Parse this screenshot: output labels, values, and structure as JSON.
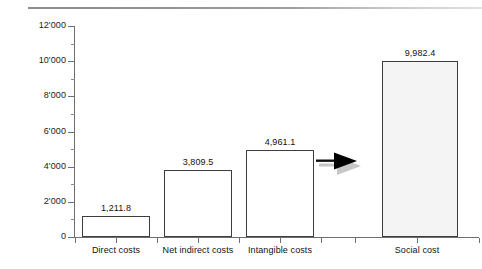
{
  "figure": {
    "background_color": "#ffffff",
    "top_rule_color": "#8d8d8d",
    "axis_color": "#6f6f6f",
    "bar_outline_color": "#3d3d3d",
    "bar_fill_color": "#ffffff",
    "bar_fill_highlight_color": "#f4f4f4",
    "arrow_color": "#000000",
    "arrow_shadow_color": "#9a9a9a"
  },
  "chart_data": {
    "type": "bar",
    "title": "",
    "subtitle": "",
    "xlabel": "",
    "ylabel": "",
    "ylim": [
      0,
      12000
    ],
    "grid": false,
    "legend": false,
    "categories": [
      "Direct costs",
      "Net indirect costs",
      "Intangible costs",
      "Social cost"
    ],
    "values": [
      1211.8,
      3809.5,
      4961.1,
      9982.4
    ],
    "value_labels": [
      "1,211.8",
      "3,809.5",
      "4,961.1",
      "9,982.4"
    ],
    "ytick_values": [
      0,
      2000,
      4000,
      6000,
      8000,
      10000,
      12000
    ],
    "ytick_labels": [
      "0",
      "2'000",
      "4'000",
      "6'000",
      "8'000",
      "10'000",
      "12'000"
    ],
    "yminor_tick_values": [
      1000,
      3000,
      5000,
      7000,
      9000,
      11000
    ],
    "annotations": [
      {
        "name": "arrow",
        "type": "arrow-right",
        "meaning": "sum of the three cost components equals the social cost"
      }
    ]
  }
}
